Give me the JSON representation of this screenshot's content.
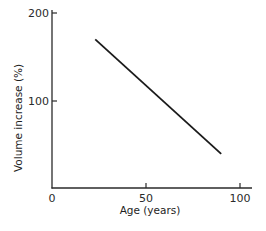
{
  "chart_data": {
    "type": "line",
    "title": "",
    "xlabel": "Age (years)",
    "ylabel": "Volume increase (%)",
    "xlim": [
      0,
      105
    ],
    "ylim": [
      0,
      200
    ],
    "xticks": [
      0,
      50,
      100
    ],
    "yticks": [
      100,
      200
    ],
    "xtick_labels": [
      "0",
      "50",
      "100"
    ],
    "ytick_labels": [
      "100",
      "200"
    ],
    "grid": false,
    "legend": null,
    "series": [
      {
        "name": "Volume increase",
        "x": [
          23,
          90
        ],
        "y": [
          170,
          40
        ],
        "color": "#1a1a1a"
      }
    ]
  },
  "colors": {
    "axis": "#2a2a2a",
    "line": "#1a1a1a",
    "background": "#ffffff"
  }
}
